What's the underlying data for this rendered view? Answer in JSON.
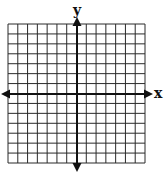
{
  "diagram": {
    "type": "coordinate-plane",
    "x_axis_label": "x",
    "y_axis_label": "y",
    "grid": {
      "columns": 14,
      "rows": 14,
      "columns_left_of_y_axis": 7,
      "columns_right_of_y_axis": 7,
      "rows_above_x_axis": 7,
      "rows_below_x_axis": 7
    },
    "arrows": [
      "left",
      "right",
      "up",
      "down"
    ],
    "colors": {
      "grid_line": "#2a2a2a",
      "axis": "#111111",
      "background": "#ffffff"
    }
  }
}
